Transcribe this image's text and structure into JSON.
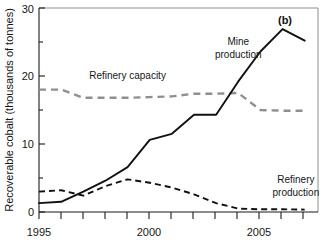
{
  "chart_data": {
    "type": "line",
    "title": "",
    "panel_label": "(b)",
    "xlabel": "",
    "ylabel": "Recoverable cobalt (thousands of tonnes)",
    "xlim": [
      1995,
      2007.6
    ],
    "ylim": [
      0,
      30
    ],
    "yticks": [
      0,
      10,
      20,
      30
    ],
    "ytick_labels": [
      "0",
      "10",
      "20",
      "30"
    ],
    "yminor_ticks": [
      5,
      15,
      25
    ],
    "xticks": [
      1995,
      1996,
      1997,
      1998,
      1999,
      2000,
      2001,
      2002,
      2003,
      2004,
      2005,
      2006,
      2007
    ],
    "xtick_labels": [
      "1995",
      "",
      "",
      "",
      "",
      "2000",
      "",
      "",
      "",
      "",
      "2005",
      "",
      ""
    ],
    "xtick_labels_shown": [
      "1995",
      "2000",
      "2005"
    ],
    "grid": false,
    "legend": "inline-annotations",
    "x": [
      1995,
      1996,
      1997,
      1998,
      1999,
      2000,
      2001,
      2002,
      2003,
      2004,
      2005,
      2006,
      2007
    ],
    "series": [
      {
        "name": "Mine production",
        "style": "solid-black",
        "color": "#111111",
        "values": [
          1.3,
          1.5,
          3.0,
          4.6,
          6.6,
          10.6,
          11.5,
          14.3,
          14.3,
          19.2,
          23.6,
          26.9,
          25.2
        ]
      },
      {
        "name": "Refinery capacity",
        "style": "dashed-gray",
        "color": "#8f8f8f",
        "values": [
          18.0,
          18.0,
          16.8,
          16.8,
          16.8,
          16.9,
          17.0,
          17.4,
          17.4,
          17.5,
          15.0,
          14.9,
          14.9
        ]
      },
      {
        "name": "Refinery production",
        "style": "dashed-black",
        "color": "#111111",
        "values": [
          3.0,
          3.2,
          2.4,
          3.8,
          4.8,
          4.3,
          3.6,
          2.6,
          1.3,
          0.5,
          0.4,
          0.4,
          0.35
        ]
      }
    ],
    "annotations": [
      {
        "text": "Mine",
        "x": 2004.0,
        "y": 24.6,
        "anchor": "middle"
      },
      {
        "text": "production",
        "x": 2004.0,
        "y": 22.7,
        "anchor": "middle"
      },
      {
        "text": "Refinery capacity",
        "x": 1999.0,
        "y": 19.6,
        "anchor": "middle"
      },
      {
        "text": "Refinery",
        "x": 2006.6,
        "y": 4.2,
        "anchor": "middle"
      },
      {
        "text": "production",
        "x": 2006.6,
        "y": 2.3,
        "anchor": "middle"
      }
    ]
  }
}
